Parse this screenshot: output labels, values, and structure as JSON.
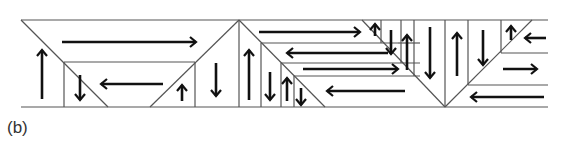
{
  "caption": "(b)",
  "diagram": {
    "stroke_color": "#555555",
    "arrow_color": "#111111",
    "rails": {
      "top_y": 20,
      "bottom_y": 107,
      "x_start": 21,
      "x_end": 548
    },
    "lines": [
      [
        21,
        20,
        108,
        107
      ],
      [
        150,
        107,
        239,
        20
      ],
      [
        64,
        62,
        195,
        62
      ],
      [
        64,
        62,
        64,
        107
      ],
      [
        195,
        62,
        195,
        107
      ],
      [
        239,
        20,
        239,
        107
      ],
      [
        239,
        20,
        325,
        107
      ],
      [
        261,
        43,
        398,
        43
      ],
      [
        261,
        43,
        261,
        107
      ],
      [
        281,
        63,
        420,
        63
      ],
      [
        281,
        63,
        281,
        107
      ],
      [
        294,
        76,
        420,
        76
      ],
      [
        294,
        76,
        294,
        107
      ],
      [
        362,
        20,
        445,
        107
      ],
      [
        381,
        20,
        381,
        43
      ],
      [
        401,
        20,
        401,
        63
      ],
      [
        414,
        20,
        414,
        76
      ],
      [
        398,
        43,
        420,
        43
      ],
      [
        445,
        20,
        445,
        107
      ],
      [
        445,
        107,
        532,
        20
      ],
      [
        468,
        20,
        468,
        85
      ],
      [
        501,
        20,
        501,
        53
      ],
      [
        501,
        53,
        548,
        53
      ],
      [
        468,
        85,
        548,
        85
      ]
    ],
    "arrows": [
      {
        "dir": "right",
        "x1": 62,
        "y1": 42,
        "x2": 196,
        "y2": 42
      },
      {
        "dir": "left",
        "x1": 163,
        "y1": 84,
        "x2": 101,
        "y2": 84
      },
      {
        "dir": "up",
        "x1": 42,
        "y1": 99,
        "x2": 42,
        "y2": 50
      },
      {
        "dir": "down",
        "x1": 80,
        "y1": 75,
        "x2": 80,
        "y2": 100
      },
      {
        "dir": "up",
        "x1": 182,
        "y1": 101,
        "x2": 182,
        "y2": 85
      },
      {
        "dir": "down",
        "x1": 216,
        "y1": 63,
        "x2": 216,
        "y2": 96
      },
      {
        "dir": "right",
        "x1": 259,
        "y1": 32,
        "x2": 360,
        "y2": 32
      },
      {
        "dir": "left",
        "x1": 388,
        "y1": 53,
        "x2": 287,
        "y2": 53
      },
      {
        "dir": "right",
        "x1": 303,
        "y1": 69,
        "x2": 398,
        "y2": 69
      },
      {
        "dir": "left",
        "x1": 405,
        "y1": 91,
        "x2": 327,
        "y2": 91
      },
      {
        "dir": "up",
        "x1": 249,
        "y1": 100,
        "x2": 249,
        "y2": 50
      },
      {
        "dir": "down",
        "x1": 270,
        "y1": 72,
        "x2": 270,
        "y2": 100
      },
      {
        "dir": "up",
        "x1": 287,
        "y1": 101,
        "x2": 287,
        "y2": 78
      },
      {
        "dir": "down",
        "x1": 301,
        "y1": 88,
        "x2": 301,
        "y2": 105
      },
      {
        "dir": "up",
        "x1": 375,
        "y1": 36,
        "x2": 375,
        "y2": 24
      },
      {
        "dir": "down",
        "x1": 391,
        "y1": 30,
        "x2": 391,
        "y2": 54
      },
      {
        "dir": "up",
        "x1": 407,
        "y1": 70,
        "x2": 407,
        "y2": 35
      },
      {
        "dir": "down",
        "x1": 430,
        "y1": 27,
        "x2": 430,
        "y2": 78
      },
      {
        "dir": "up",
        "x1": 457,
        "y1": 76,
        "x2": 457,
        "y2": 33
      },
      {
        "dir": "down",
        "x1": 483,
        "y1": 30,
        "x2": 483,
        "y2": 65
      },
      {
        "dir": "up",
        "x1": 511,
        "y1": 40,
        "x2": 511,
        "y2": 26
      },
      {
        "dir": "left",
        "x1": 546,
        "y1": 38,
        "x2": 525,
        "y2": 38
      },
      {
        "dir": "right",
        "x1": 503,
        "y1": 69,
        "x2": 537,
        "y2": 69
      },
      {
        "dir": "left",
        "x1": 544,
        "y1": 97,
        "x2": 471,
        "y2": 97
      }
    ]
  }
}
